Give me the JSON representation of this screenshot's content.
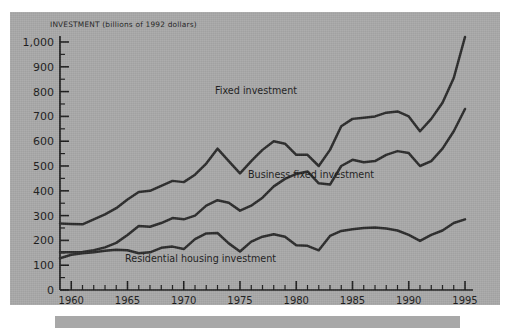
{
  "figure": {
    "axis_title": "INVESTMENT (billions of 1992 dollars)",
    "background_color": "#a8a8a8",
    "line_color": "#2a2a2a",
    "text_color": "#1a1a1a"
  },
  "labels": {
    "fixed": "Fixed investment",
    "business": "Business fixed investment",
    "residential": "Residential housing investment"
  },
  "chart_data": {
    "type": "line",
    "title": "INVESTMENT (billions of 1992 dollars)",
    "xlabel": "",
    "ylabel": "INVESTMENT (billions of 1992 dollars)",
    "xlim": [
      1959,
      1995
    ],
    "ylim": [
      0,
      1050
    ],
    "yticks": [
      0,
      100,
      200,
      300,
      400,
      500,
      600,
      700,
      800,
      900,
      1000
    ],
    "ytick_labels": [
      "0",
      "100",
      "200",
      "300",
      "400",
      "500",
      "600",
      "700",
      "800",
      "900",
      "1,000"
    ],
    "yminor_step": 50,
    "xticks": [
      1960,
      1961,
      1962,
      1963,
      1964,
      1965,
      1966,
      1967,
      1968,
      1969,
      1970,
      1971,
      1972,
      1973,
      1974,
      1975,
      1976,
      1977,
      1978,
      1979,
      1980,
      1981,
      1982,
      1983,
      1984,
      1985,
      1986,
      1987,
      1988,
      1989,
      1990,
      1991,
      1992,
      1993,
      1994,
      1995
    ],
    "xtick_labels_shown": [
      "1960",
      "1965",
      "1970",
      "1975",
      "1980",
      "1985",
      "1990",
      "1995"
    ],
    "xtick_label_years": [
      1960,
      1965,
      1970,
      1975,
      1980,
      1985,
      1990,
      1995
    ],
    "grid": false,
    "legend": "inline annotations",
    "x": [
      1959,
      1960,
      1961,
      1962,
      1963,
      1964,
      1965,
      1966,
      1967,
      1968,
      1969,
      1970,
      1971,
      1972,
      1973,
      1974,
      1975,
      1976,
      1977,
      1978,
      1979,
      1980,
      1981,
      1982,
      1983,
      1984,
      1985,
      1986,
      1987,
      1988,
      1989,
      1990,
      1991,
      1992,
      1993,
      1994,
      1995
    ],
    "series": [
      {
        "name": "Fixed investment",
        "values": [
          268,
          266,
          265,
          285,
          305,
          330,
          365,
          395,
          400,
          420,
          440,
          435,
          465,
          510,
          570,
          520,
          470,
          520,
          565,
          600,
          590,
          545,
          545,
          500,
          565,
          660,
          690,
          695,
          700,
          715,
          720,
          700,
          640,
          690,
          755,
          855,
          1020
        ]
      },
      {
        "name": "Business fixed investment",
        "values": [
          152,
          152,
          153,
          160,
          172,
          190,
          222,
          258,
          255,
          270,
          290,
          285,
          300,
          340,
          362,
          352,
          320,
          340,
          372,
          418,
          448,
          468,
          478,
          430,
          425,
          500,
          525,
          515,
          520,
          545,
          560,
          552,
          500,
          520,
          570,
          640,
          730
        ]
      },
      {
        "name": "Residential housing investment",
        "values": [
          128,
          142,
          148,
          152,
          158,
          162,
          160,
          148,
          152,
          170,
          175,
          165,
          205,
          228,
          230,
          188,
          155,
          195,
          215,
          225,
          215,
          180,
          178,
          160,
          218,
          238,
          245,
          250,
          252,
          248,
          240,
          222,
          198,
          222,
          240,
          270,
          285
        ]
      }
    ]
  }
}
